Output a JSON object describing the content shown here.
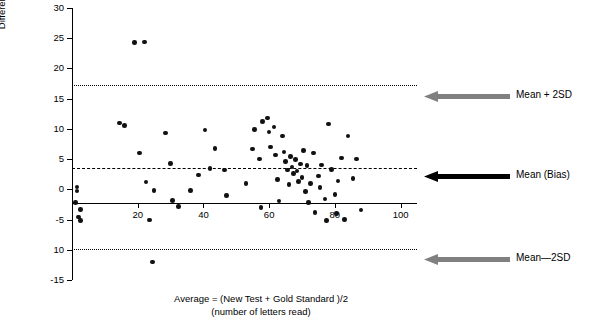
{
  "chart_data": {
    "type": "scatter",
    "title": "",
    "xlabel": "Average = (New Test + Gold Standard )/2 (number of letters read)",
    "xlabel_line1": "Average = (New Test + Gold Standard )/2",
    "xlabel_line2": "(number of letters read)",
    "ylabel": "Difference New Test – Gold Standard Test (number of letters read)",
    "ylabel_line1": "Difference New Test – Gold Standard Test",
    "ylabel_line2": "(number of letters read)",
    "xlim": [
      0,
      105
    ],
    "ylim": [
      -15,
      30
    ],
    "xticks": [
      20,
      40,
      60,
      80,
      100
    ],
    "yticks": [
      -15,
      -10,
      -5,
      0,
      5,
      10,
      15,
      20,
      25,
      30
    ],
    "ytick_labels": [
      "-15",
      "10",
      "-5",
      "0",
      "5",
      "10",
      "15",
      "20",
      "25",
      "30"
    ],
    "grid": false,
    "legend": "none",
    "reference_lines": [
      {
        "name": "mean-plus-2sd",
        "label": "Mean + 2SD",
        "value": 17.2,
        "style": "dotted"
      },
      {
        "name": "mean-bias",
        "label": "Mean (Bias)",
        "value": 3.6,
        "style": "dashed"
      },
      {
        "name": "mean-minus-2sd",
        "label": "Mean—2SD",
        "value": -9.9,
        "style": "dotted"
      }
    ],
    "points": [
      {
        "x": 1.5,
        "y": 0.4
      },
      {
        "x": 1.5,
        "y": -0.3
      },
      {
        "x": 1.0,
        "y": -2.2
      },
      {
        "x": 2.5,
        "y": -3.3
      },
      {
        "x": 2.0,
        "y": -4.6
      },
      {
        "x": 2.5,
        "y": -5.2
      },
      {
        "x": 14.5,
        "y": 11.0
      },
      {
        "x": 16.0,
        "y": 10.6
      },
      {
        "x": 19.0,
        "y": 24.3
      },
      {
        "x": 22.0,
        "y": 24.4
      },
      {
        "x": 20.5,
        "y": 6.0
      },
      {
        "x": 22.5,
        "y": 1.2
      },
      {
        "x": 25.0,
        "y": -0.2
      },
      {
        "x": 23.5,
        "y": -5.1
      },
      {
        "x": 24.5,
        "y": -12.0
      },
      {
        "x": 28.5,
        "y": 9.3
      },
      {
        "x": 30.0,
        "y": 4.3
      },
      {
        "x": 30.5,
        "y": -1.8
      },
      {
        "x": 32.5,
        "y": -2.8
      },
      {
        "x": 36.0,
        "y": -0.2
      },
      {
        "x": 38.5,
        "y": 2.4
      },
      {
        "x": 40.5,
        "y": 9.8
      },
      {
        "x": 42.0,
        "y": 3.4
      },
      {
        "x": 43.5,
        "y": 6.8
      },
      {
        "x": 46.5,
        "y": 3.2
      },
      {
        "x": 47.0,
        "y": -1.0
      },
      {
        "x": 53.0,
        "y": 1.0
      },
      {
        "x": 55.0,
        "y": 6.7
      },
      {
        "x": 55.5,
        "y": 9.9
      },
      {
        "x": 57.0,
        "y": 5.0
      },
      {
        "x": 57.5,
        "y": -3.0
      },
      {
        "x": 58.0,
        "y": 11.2
      },
      {
        "x": 59.5,
        "y": 11.8
      },
      {
        "x": 60.0,
        "y": 9.5
      },
      {
        "x": 60.5,
        "y": 7.0
      },
      {
        "x": 61.5,
        "y": 10.3
      },
      {
        "x": 62.0,
        "y": 5.7
      },
      {
        "x": 62.5,
        "y": 1.6
      },
      {
        "x": 63.0,
        "y": -1.9
      },
      {
        "x": 64.0,
        "y": 8.8
      },
      {
        "x": 64.5,
        "y": 6.2
      },
      {
        "x": 65.0,
        "y": 4.6
      },
      {
        "x": 65.5,
        "y": 3.2
      },
      {
        "x": 66.0,
        "y": 0.8
      },
      {
        "x": 66.5,
        "y": 5.4
      },
      {
        "x": 67.0,
        "y": 3.7
      },
      {
        "x": 67.5,
        "y": 2.6
      },
      {
        "x": 68.0,
        "y": 4.9
      },
      {
        "x": 68.5,
        "y": 3.0
      },
      {
        "x": 69.0,
        "y": 1.3
      },
      {
        "x": 69.5,
        "y": 4.2
      },
      {
        "x": 70.0,
        "y": 2.0
      },
      {
        "x": 70.5,
        "y": 6.4
      },
      {
        "x": 71.0,
        "y": -0.4
      },
      {
        "x": 71.5,
        "y": 3.9
      },
      {
        "x": 72.0,
        "y": -2.2
      },
      {
        "x": 72.5,
        "y": 1.0
      },
      {
        "x": 73.5,
        "y": 6.0
      },
      {
        "x": 74.0,
        "y": -3.8
      },
      {
        "x": 75.0,
        "y": 2.2
      },
      {
        "x": 75.5,
        "y": 0.3
      },
      {
        "x": 76.0,
        "y": 4.0
      },
      {
        "x": 77.0,
        "y": -1.6
      },
      {
        "x": 77.5,
        "y": -5.2
      },
      {
        "x": 78.0,
        "y": 10.8
      },
      {
        "x": 79.0,
        "y": 3.3
      },
      {
        "x": 80.0,
        "y": -0.9
      },
      {
        "x": 80.5,
        "y": -4.0
      },
      {
        "x": 81.0,
        "y": 1.4
      },
      {
        "x": 82.0,
        "y": 5.2
      },
      {
        "x": 83.0,
        "y": -5.0
      },
      {
        "x": 84.0,
        "y": 8.8
      },
      {
        "x": 85.5,
        "y": 1.8
      },
      {
        "x": 86.5,
        "y": 5.0
      },
      {
        "x": 88.0,
        "y": -3.4
      }
    ]
  },
  "annotations": {
    "top": "Mean + 2SD",
    "middle": "Mean (Bias)",
    "bottom": "Mean—2SD"
  },
  "colors": {
    "data_point": "#111111",
    "axis": "#000000",
    "arrow_gray": "#808080",
    "arrow_black": "#000000"
  }
}
